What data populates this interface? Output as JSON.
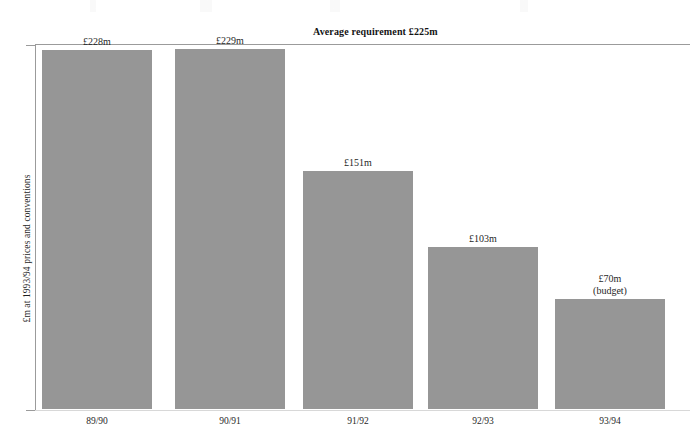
{
  "chart_data": {
    "type": "bar",
    "title": "",
    "xlabel": "",
    "ylabel": "£m at 1993/94 prices and conventions",
    "categories": [
      "89/90",
      "90/91",
      "91/92",
      "92/93",
      "93/94"
    ],
    "values": [
      228,
      229,
      151,
      103,
      70
    ],
    "value_labels": [
      "£228m",
      "£229m",
      "£151m",
      "£103m",
      "£70m\n(budget)"
    ],
    "units": "£m",
    "ylim": [
      0,
      232
    ],
    "grid": false,
    "legend": "none",
    "bar_color": "#969696",
    "annotations": [
      {
        "name": "average-requirement",
        "label": "Average requirement £225m",
        "value": 225,
        "orientation": "horizontal",
        "style": "bold",
        "color": "#9b9b9b"
      }
    ],
    "notes": [
      {
        "category": "93/94",
        "note": "(budget)"
      }
    ]
  },
  "axes": {
    "y": {
      "title": "£m at 1993/94 prices and conventions",
      "tick_labels": []
    },
    "x": {
      "tick_labels": [
        "89/90",
        "90/91",
        "91/92",
        "92/93",
        "93/94"
      ]
    }
  },
  "series": [
    {
      "category": "89/90",
      "value": 228,
      "value_label": "£228m",
      "label_line2": ""
    },
    {
      "category": "90/91",
      "value": 229,
      "value_label": "£229m",
      "label_line2": ""
    },
    {
      "category": "91/92",
      "value": 151,
      "value_label": "£151m",
      "label_line2": ""
    },
    {
      "category": "92/93",
      "value": 103,
      "value_label": "£103m",
      "label_line2": ""
    },
    {
      "category": "93/94",
      "value": 70,
      "value_label": "£70m",
      "label_line2": "(budget)"
    }
  ],
  "average": {
    "label": "Average requirement £225m",
    "value": 225
  },
  "colors": {
    "bar": "#969696",
    "axis": "#9b9b9b",
    "text": "#1f1f1f"
  }
}
